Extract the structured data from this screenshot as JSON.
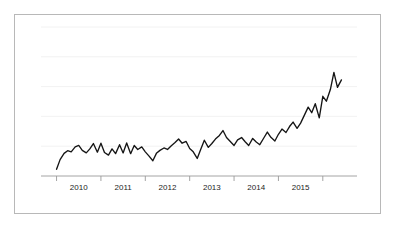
{
  "figure": {
    "background_color": "#ffffff",
    "card_border_color": "#b8b8b8",
    "gridline_color": "#f0f0f0",
    "axis_color": "#9a9a9a",
    "series_color": "#151515"
  },
  "chart_data": {
    "type": "line",
    "title": "",
    "subtitle": "",
    "xlabel": "",
    "ylabel": "",
    "grid": true,
    "legend": false,
    "legend_position": "none",
    "xlim": [
      2009.42,
      2016.0
    ],
    "ylim": [
      0,
      10
    ],
    "x_tick_labels": [
      "2010",
      "2011",
      "2012",
      "2013",
      "2014",
      "2015"
    ],
    "x_tick_values": [
      2010,
      2011,
      2012,
      2013,
      2014,
      2015
    ],
    "x_minor_tick_values": [
      2009.5,
      2010.5,
      2011.5,
      2012.5,
      2013.5,
      2014.5,
      2015.5
    ],
    "y_gridline_values": [
      2,
      4,
      6,
      8,
      10
    ],
    "y_tick_labels": [],
    "series": [
      {
        "name": "series-1",
        "color": "#151515",
        "x": [
          2009.5,
          2009.58,
          2009.67,
          2009.75,
          2009.83,
          2009.92,
          2010.0,
          2010.08,
          2010.17,
          2010.25,
          2010.33,
          2010.42,
          2010.5,
          2010.58,
          2010.67,
          2010.75,
          2010.83,
          2010.92,
          2011.0,
          2011.08,
          2011.17,
          2011.25,
          2011.33,
          2011.42,
          2011.5,
          2011.58,
          2011.67,
          2011.75,
          2011.83,
          2011.92,
          2012.0,
          2012.08,
          2012.17,
          2012.25,
          2012.33,
          2012.42,
          2012.5,
          2012.58,
          2012.67,
          2012.75,
          2012.83,
          2012.92,
          2013.0,
          2013.08,
          2013.17,
          2013.25,
          2013.33,
          2013.42,
          2013.5,
          2013.58,
          2013.67,
          2013.75,
          2013.83,
          2013.92,
          2014.0,
          2014.08,
          2014.17,
          2014.25,
          2014.33,
          2014.42,
          2014.5,
          2014.58,
          2014.67,
          2014.75,
          2014.83,
          2014.92,
          2015.0,
          2015.08,
          2015.17,
          2015.25,
          2015.33,
          2015.42,
          2015.5,
          2015.58,
          2015.67,
          2015.75,
          2015.83,
          2015.92
        ],
        "values": [
          0.45,
          1.1,
          1.52,
          1.7,
          1.62,
          1.95,
          2.05,
          1.72,
          1.55,
          1.82,
          2.18,
          1.6,
          2.2,
          1.58,
          1.4,
          1.82,
          1.5,
          2.1,
          1.55,
          2.22,
          1.5,
          2.05,
          1.78,
          1.95,
          1.62,
          1.35,
          1.02,
          1.52,
          1.72,
          1.88,
          1.78,
          2.02,
          2.25,
          2.48,
          2.2,
          2.32,
          1.85,
          1.62,
          1.18,
          1.8,
          2.4,
          1.92,
          2.18,
          2.48,
          2.72,
          3.05,
          2.58,
          2.3,
          2.05,
          2.42,
          2.58,
          2.3,
          2.05,
          2.52,
          2.28,
          2.1,
          2.55,
          2.95,
          2.6,
          2.35,
          2.8,
          3.15,
          2.92,
          3.32,
          3.62,
          3.2,
          3.55,
          4.05,
          4.62,
          4.25,
          4.85,
          3.9,
          5.35,
          5.02,
          5.8,
          6.95,
          5.95,
          6.45
        ]
      }
    ]
  }
}
